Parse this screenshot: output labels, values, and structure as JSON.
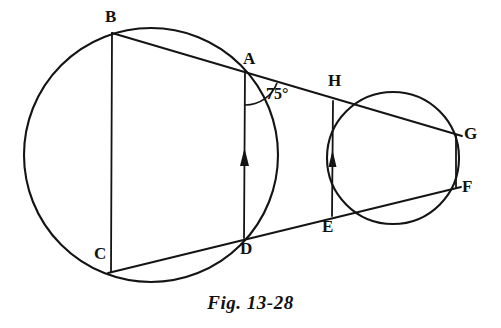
{
  "figure": {
    "caption": "Fig. 13-28",
    "stroke_color": "#141414",
    "background_color": "#ffffff",
    "angle_annotation": {
      "id": "angle-75",
      "text": "75°",
      "vertex": "A",
      "x": 266,
      "y": 86
    },
    "circles": [
      {
        "id": "large-circle",
        "cx": 151,
        "cy": 155,
        "r": 127
      },
      {
        "id": "small-circle",
        "cx": 393,
        "cy": 158,
        "r": 66
      }
    ],
    "points": [
      {
        "id": "B",
        "label": "B",
        "x": 112,
        "y": 33,
        "label_x": 105,
        "label_y": 8
      },
      {
        "id": "A",
        "label": "A",
        "x": 245,
        "y": 71,
        "label_x": 243,
        "label_y": 50
      },
      {
        "id": "C",
        "label": "C",
        "x": 111,
        "y": 272,
        "label_x": 94,
        "label_y": 245
      },
      {
        "id": "D",
        "label": "D",
        "x": 244,
        "y": 238,
        "label_x": 240,
        "label_y": 240
      },
      {
        "id": "H",
        "label": "H",
        "x": 333,
        "y": 101,
        "label_x": 328,
        "label_y": 72
      },
      {
        "id": "E",
        "label": "E",
        "x": 331,
        "y": 216,
        "label_x": 322,
        "label_y": 218
      },
      {
        "id": "G",
        "label": "G",
        "x": 456,
        "y": 135,
        "label_x": 464,
        "label_y": 125
      },
      {
        "id": "F",
        "label": "F",
        "x": 456,
        "y": 187,
        "label_x": 462,
        "label_y": 178
      }
    ],
    "segments": [
      {
        "id": "secant-B-A-H-G",
        "from": "B",
        "to": "G",
        "x1": 112,
        "y1": 33,
        "x2": 462,
        "y2": 136
      },
      {
        "id": "secant-C-D-E-F",
        "from": "C",
        "to": "F",
        "x1": 108,
        "y1": 273,
        "x2": 461,
        "y2": 187
      },
      {
        "id": "chord-B-C",
        "from": "B",
        "to": "C",
        "x1": 112,
        "y1": 33,
        "x2": 111,
        "y2": 272
      },
      {
        "id": "chord-G-F",
        "from": "G",
        "to": "F",
        "x1": 456,
        "y1": 135,
        "x2": 456,
        "y2": 187
      }
    ],
    "arrow_segments": [
      {
        "id": "arrow-chord-D-A",
        "from": "D",
        "to": "A",
        "x1": 244,
        "y1": 238,
        "x2": 245,
        "y2": 71,
        "arrow_tip_y": 150
      },
      {
        "id": "arrow-chord-E-H",
        "from": "E",
        "to": "H",
        "x1": 332,
        "y1": 216,
        "x2": 333,
        "y2": 101,
        "arrow_tip_y": 152
      }
    ]
  }
}
